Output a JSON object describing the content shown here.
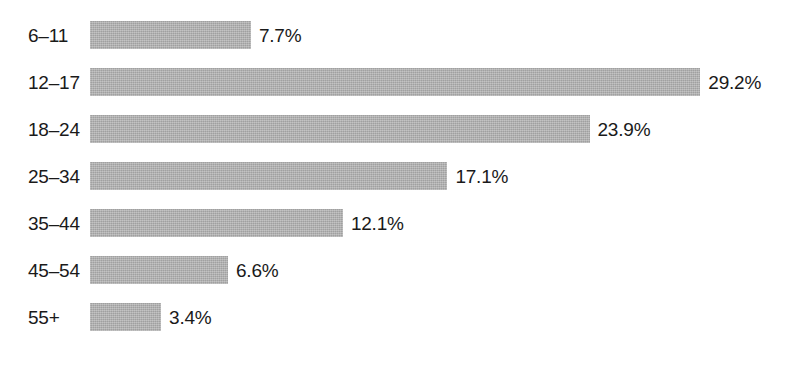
{
  "chart_data": {
    "type": "bar",
    "orientation": "horizontal",
    "title": "",
    "subtitle": "",
    "xlabel": "",
    "ylabel": "",
    "grid": false,
    "legend": false,
    "axis_visible": false,
    "value_suffix": "%",
    "xlim": [
      0,
      29.2
    ],
    "categories": [
      "6–11",
      "12–17",
      "18–24",
      "25–34",
      "35–44",
      "45–54",
      "55+"
    ],
    "values": [
      7.7,
      29.2,
      23.9,
      17.1,
      12.1,
      6.6,
      3.4
    ],
    "value_labels": [
      "7.7%",
      "29.2%",
      "23.9%",
      "17.1%",
      "12.1%",
      "6.6%",
      "3.4%"
    ],
    "colors": {
      "bar_fill": "#aeaeae",
      "text": "#1a1a1a",
      "background": "#ffffff"
    },
    "layout": {
      "bar_left_px": 90,
      "bar_height_px": 28,
      "row_pitch_px": 47,
      "first_row_top_px": 21,
      "px_per_percent": 20.9,
      "label_left_px": 28
    }
  }
}
